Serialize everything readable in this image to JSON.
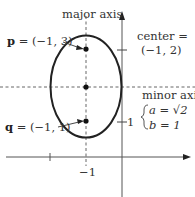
{
  "figure": {
    "type": "ellipse-diagram",
    "labels": {
      "major_axis": "major axis",
      "minor_axis": "minor axis",
      "center_line1": "center =",
      "center_line2": "(−1, 2)",
      "p_bold": "p",
      "p_rest": " = (−1, 3)",
      "q_bold": "q",
      "q_rest": " = (−1, 1)",
      "a_eq": "a = √2",
      "b_eq": "b = 1",
      "tick_x_neg1": "−1",
      "tick_y_1": "1"
    },
    "ellipse": {
      "center": [
        -1,
        2
      ],
      "a": 1.4142,
      "b": 1,
      "orientation": "vertical major axis"
    },
    "points": [
      {
        "name": "p",
        "coords": [
          -1,
          3
        ]
      },
      {
        "name": "q",
        "coords": [
          -1,
          1
        ]
      },
      {
        "name": "center",
        "coords": [
          -1,
          2
        ]
      }
    ],
    "colors": {
      "stroke": "#222222",
      "dashed": "#555555",
      "text": "#333333"
    }
  }
}
